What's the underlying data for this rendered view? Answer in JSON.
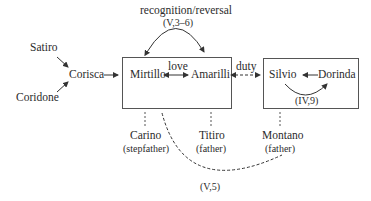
{
  "diagram": {
    "nodes": {
      "satiro": "Satiro",
      "coridone": "Coridone",
      "corisca": "Corisca",
      "mirtillo": "Mirtillo",
      "amarilli": "Amarilli",
      "silvio": "Silvio",
      "dorinda": "Dorinda",
      "carino": "Carino",
      "titiro": "Titiro",
      "montano": "Montano"
    },
    "roles": {
      "carino": "(stepfather)",
      "titiro": "(father)",
      "montano": "(father)"
    },
    "edge_labels": {
      "recognition": "recognition/reversal",
      "recognition_ref": "(V,3–6)",
      "love": "love",
      "duty": "duty",
      "silvio_dorinda_ref": "(IV,9)",
      "mirtillo_montano_ref": "(V,5)"
    },
    "colors": {
      "line": "#333333",
      "box_border": "#555555",
      "text": "#2b2b2b"
    }
  }
}
